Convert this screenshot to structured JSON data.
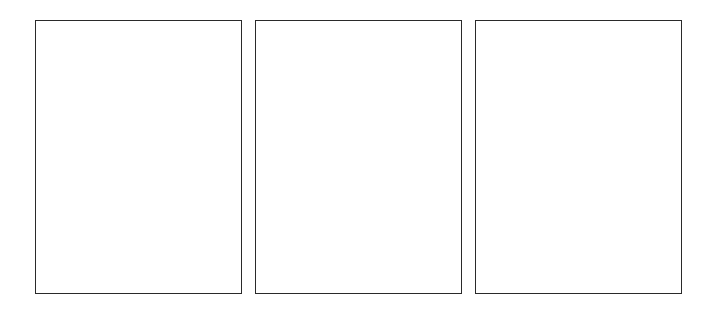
{
  "panels": [
    {
      "label": ""
    },
    {
      "label": ""
    },
    {
      "label": ""
    }
  ],
  "colors": {
    "background": "#ffffff",
    "border": "#2a2a2a"
  }
}
